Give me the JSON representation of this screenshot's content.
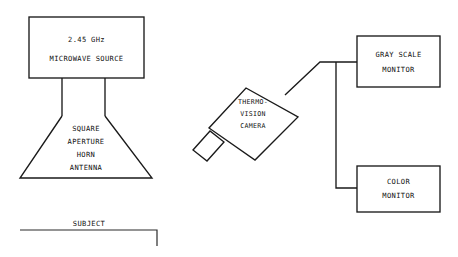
{
  "diagram": {
    "background_color": "#ffffff",
    "line_color": "#1a1a1a",
    "blocks": {
      "microwave_source": {
        "line1": "2.45 GHz",
        "line2": "MICROWAVE SOURCE"
      },
      "horn_antenna": {
        "line1": "SQUARE",
        "line2": "APERTURE",
        "line3": "HORN",
        "line4": "ANTENNA"
      },
      "thermovision_camera": {
        "line1": "THERMO-",
        "line2": "VISION",
        "line3": "CAMERA"
      },
      "gray_scale_monitor": {
        "line1": "GRAY SCALE",
        "line2": "MONITOR"
      },
      "color_monitor": {
        "line1": "COLOR",
        "line2": "MONITOR"
      },
      "subject": {
        "label": "SUBJECT"
      }
    }
  }
}
